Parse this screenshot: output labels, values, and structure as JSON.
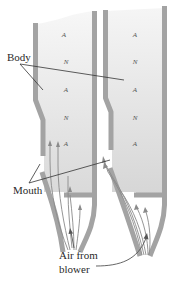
{
  "figure": {
    "colors": {
      "wall": "#a3a3a3",
      "air_column_top": "#f4f4f4",
      "air_column_bottom": "#dcdcdc",
      "text": "#2a2a2a",
      "node_text": "#555555",
      "flow_lines": "#8a8a8a"
    }
  },
  "labels": {
    "body": "Body",
    "mouth": "Mouth",
    "air_from_blower_line1": "Air from",
    "air_from_blower_line2": "blower"
  },
  "pipes": [
    {
      "name": "left-pipe",
      "markers": [
        "A",
        "N",
        "A",
        "N",
        "A"
      ]
    },
    {
      "name": "right-pipe",
      "markers": [
        "A",
        "N",
        "A",
        "N",
        "A"
      ]
    }
  ]
}
